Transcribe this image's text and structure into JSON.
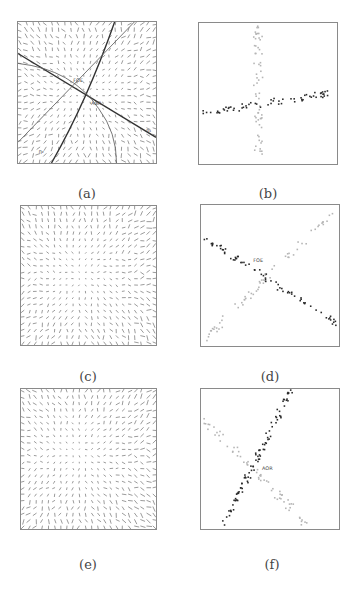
{
  "figure": {
    "panels": [
      {
        "id": "a",
        "caption": "(a)",
        "type": "flow-field-with-lines",
        "box": {
          "x": 17,
          "y": 21,
          "w": 140,
          "h": 143
        },
        "caption_pos": {
          "x": 87,
          "y": 186
        },
        "grid": {
          "cols": 22,
          "rows": 22,
          "seed": 11,
          "needle_len": 3.2,
          "color": "#555"
        },
        "lines": [
          {
            "name": "dark-line-1",
            "x1": 0,
            "y1": 32,
            "x2": 140,
            "y2": 117,
            "width": 1.4,
            "color": "#333"
          },
          {
            "name": "dark-curve-2",
            "path": "M 34 143 Q 70 80 98 0",
            "width": 1.4,
            "color": "#333"
          },
          {
            "name": "thin-line-3",
            "x1": 0,
            "y1": 122,
            "x2": 118,
            "y2": 0,
            "width": 0.9,
            "color": "#666"
          },
          {
            "name": "thin-curve-4",
            "path": "M 0 42 Q 55 48 82 88 Q 100 112 100 143",
            "width": 0.9,
            "color": "#666"
          }
        ],
        "labels": [
          {
            "text": "FOE",
            "x": 56,
            "y": 61
          },
          {
            "text": "AOR",
            "x": 74,
            "y": 84
          },
          {
            "text": "η₁",
            "x": 130,
            "y": 112
          },
          {
            "text": "η₂",
            "x": 21,
            "y": 133
          }
        ]
      },
      {
        "id": "b",
        "caption": "(b)",
        "type": "scatter",
        "box": {
          "x": 198,
          "y": 22,
          "w": 140,
          "h": 143
        },
        "caption_pos": {
          "x": 268,
          "y": 186
        },
        "series": [
          {
            "name": "light-points-vertical",
            "color": "#b5b5b5",
            "count": 60,
            "seed": 3,
            "from": {
              "x": 60,
              "y": 3
            },
            "to": {
              "x": 60,
              "y": 138
            },
            "spread": 9
          },
          {
            "name": "dark-points-horizontal",
            "color": "#2a2a2a",
            "count": 62,
            "seed": 5,
            "from": {
              "x": 1,
              "y": 92
            },
            "to": {
              "x": 139,
              "y": 70
            },
            "spread": 7
          }
        ],
        "labels": []
      },
      {
        "id": "c",
        "caption": "(c)",
        "type": "flow-field",
        "box": {
          "x": 20,
          "y": 205,
          "w": 137,
          "h": 141
        },
        "caption_pos": {
          "x": 88,
          "y": 369
        },
        "grid": {
          "cols": 22,
          "rows": 22,
          "seed": 21,
          "needle_len": 3.0,
          "color": "#555",
          "center": {
            "x": 60,
            "y": 70
          }
        },
        "lines": [],
        "labels": []
      },
      {
        "id": "d",
        "caption": "(d)",
        "type": "scatter",
        "box": {
          "x": 200,
          "y": 204,
          "w": 140,
          "h": 143
        },
        "caption_pos": {
          "x": 270,
          "y": 369
        },
        "series": [
          {
            "name": "light-points-rising",
            "color": "#b5b5b5",
            "count": 62,
            "seed": 7,
            "from": {
              "x": 3,
              "y": 138
            },
            "to": {
              "x": 135,
              "y": 5
            },
            "spread": 7
          },
          {
            "name": "dark-points-falling",
            "color": "#2a2a2a",
            "count": 70,
            "seed": 9,
            "from": {
              "x": 3,
              "y": 33
            },
            "to": {
              "x": 137,
              "y": 120
            },
            "spread": 6
          }
        ],
        "labels": [
          {
            "text": "FOE",
            "x": 53,
            "y": 58
          }
        ]
      },
      {
        "id": "e",
        "caption": "(e)",
        "type": "flow-field",
        "box": {
          "x": 20,
          "y": 388,
          "w": 137,
          "h": 142
        },
        "caption_pos": {
          "x": 88,
          "y": 557
        },
        "grid": {
          "cols": 22,
          "rows": 22,
          "seed": 31,
          "needle_len": 3.0,
          "color": "#555",
          "center": {
            "x": 55,
            "y": 65
          }
        },
        "lines": [],
        "labels": []
      },
      {
        "id": "f",
        "caption": "(f)",
        "type": "scatter",
        "box": {
          "x": 200,
          "y": 388,
          "w": 140,
          "h": 142
        },
        "caption_pos": {
          "x": 272,
          "y": 557
        },
        "series": [
          {
            "name": "light-points-falling",
            "color": "#b5b5b5",
            "count": 62,
            "seed": 13,
            "from": {
              "x": 4,
              "y": 32
            },
            "to": {
              "x": 108,
              "y": 138
            },
            "spread": 7
          },
          {
            "name": "dark-points-rising",
            "color": "#2a2a2a",
            "count": 90,
            "seed": 17,
            "from": {
              "x": 22,
              "y": 140
            },
            "to": {
              "x": 92,
              "y": 0
            },
            "spread": 6
          }
        ],
        "labels": [
          {
            "text": "AOR",
            "x": 62,
            "y": 82
          }
        ]
      }
    ]
  }
}
